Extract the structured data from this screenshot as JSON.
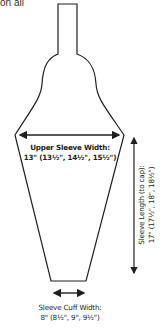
{
  "fragment_text": "on all",
  "diagram": {
    "shape": "sleeve with cap",
    "labels": {
      "upper_width_title": "Upper Sleeve Width:",
      "upper_width_value": "13\" (13½\", 14½\", 15½\")",
      "length_title": "Sleeve Length (to cap):",
      "length_value": "17\" (17½\", 18\", 18½\")",
      "cuff_title": "Sleeve Cuff Width:",
      "cuff_value": "8\" (8½\", 9\", 9½\")"
    },
    "colors": {
      "stroke": "#231f20",
      "background": "#ffffff"
    }
  }
}
